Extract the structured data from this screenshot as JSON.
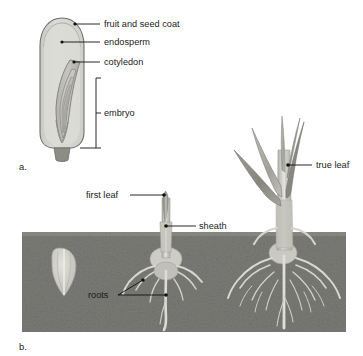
{
  "figure": {
    "panels": [
      {
        "id": "a",
        "label": "a.",
        "caption": "Monocot seed longitudinal section"
      },
      {
        "id": "b",
        "label": "b.",
        "caption": "Germination and seedling development"
      }
    ]
  },
  "panel_a": {
    "label": "a.",
    "labels": [
      {
        "key": "fruit_and_seed_coat",
        "text": "fruit and seed coat"
      },
      {
        "key": "endosperm",
        "text": "endosperm"
      },
      {
        "key": "cotyledon",
        "text": "cotyledon"
      },
      {
        "key": "embryo",
        "text": "embryo"
      }
    ],
    "colors": {
      "seed_coat_outline": "#6e6e6e",
      "endosperm_fill": "#d7d7d2",
      "embryo_fill": "#c2c2bb",
      "cotyledon_fill": "#b5b5ad",
      "stalk_fill": "#8f8f88"
    }
  },
  "panel_b": {
    "label": "b.",
    "labels": [
      {
        "key": "first_leaf",
        "text": "first leaf"
      },
      {
        "key": "sheath",
        "text": "sheath"
      },
      {
        "key": "roots",
        "text": "roots"
      },
      {
        "key": "true_leaf",
        "text": "true leaf"
      }
    ],
    "stages": [
      {
        "key": "stage-1",
        "name": "ungerminated seed in soil"
      },
      {
        "key": "stage-2",
        "name": "seedling with first leaf, sheath and seminal roots"
      },
      {
        "key": "stage-3",
        "name": "established seedling with true leaves and fibrous roots"
      }
    ],
    "colors": {
      "soil": "#7c7c78",
      "soil_dark": "#6a6a66",
      "sky": "#ffffff",
      "shoot": "#cfcfc8",
      "leaf_dark": "#8e8e86",
      "leaf_light": "#b9b9b1",
      "root": "#d9d9d2",
      "seed": "#cfcfc7"
    }
  }
}
